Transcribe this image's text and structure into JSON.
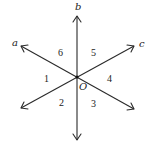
{
  "diagram": {
    "center": {
      "label": "O",
      "x": 77,
      "y": 77
    },
    "lines": [
      {
        "name": "a",
        "tip": {
          "x": 21,
          "y": 46
        },
        "tail": {
          "x": 134,
          "y": 109
        },
        "label_pos": {
          "x": 15,
          "y": 45
        }
      },
      {
        "name": "b",
        "tip": {
          "x": 77,
          "y": 16
        },
        "tail": {
          "x": 77,
          "y": 140
        },
        "label_pos": {
          "x": 76,
          "y": 9
        }
      },
      {
        "name": "c",
        "tip": {
          "x": 134,
          "y": 46
        },
        "tail": {
          "x": 21,
          "y": 108
        },
        "label_pos": {
          "x": 140,
          "y": 46
        }
      }
    ],
    "angles": [
      {
        "label": "1",
        "x": 46,
        "y": 81
      },
      {
        "label": "2",
        "x": 61,
        "y": 106
      },
      {
        "label": "3",
        "x": 93,
        "y": 106
      },
      {
        "label": "4",
        "x": 109,
        "y": 81
      },
      {
        "label": "5",
        "x": 94,
        "y": 56
      },
      {
        "label": "6",
        "x": 61,
        "y": 56
      }
    ],
    "center_label": "O",
    "colors": {
      "stroke": "#2a2a2a",
      "text": "#222222",
      "background": "#ffffff"
    }
  }
}
